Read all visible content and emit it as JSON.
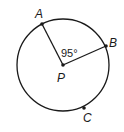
{
  "diagram": {
    "type": "circle-geometry",
    "circle": {
      "center_label": "P",
      "cx": 63,
      "cy": 65,
      "r": 46
    },
    "points": [
      {
        "label": "A",
        "x": 42,
        "y": 24,
        "label_x": 35,
        "label_y": 18
      },
      {
        "label": "B",
        "x": 106,
        "y": 46,
        "label_x": 110,
        "label_y": 46
      },
      {
        "label": "C",
        "x": 84,
        "y": 108,
        "label_x": 84,
        "label_y": 122
      },
      {
        "label": "P",
        "x": 63,
        "y": 65,
        "label_x": 57,
        "label_y": 81
      }
    ],
    "angle_label": "95°",
    "angle_between": [
      "A",
      "B"
    ],
    "colors": {
      "stroke": "#1a1a1a",
      "background": "#ffffff"
    }
  }
}
